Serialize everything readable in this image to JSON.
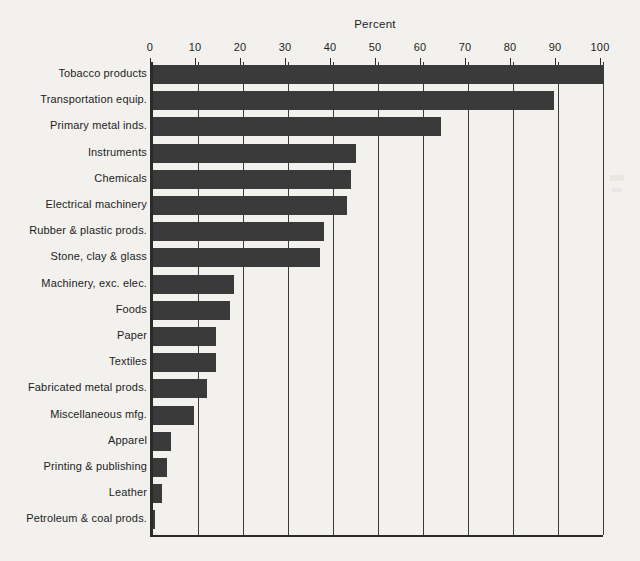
{
  "chart_data": {
    "type": "bar",
    "orientation": "horizontal",
    "title": "Percent",
    "xlabel": "Percent",
    "ylabel": "",
    "xlim": [
      0,
      100
    ],
    "grid": true,
    "legend": false,
    "xticks": [
      0,
      10,
      20,
      30,
      40,
      50,
      60,
      70,
      80,
      90,
      100
    ],
    "xtick_labels": [
      "0",
      "10",
      "20",
      "30",
      "40",
      "50",
      "60",
      "70",
      "80",
      "90",
      "100"
    ],
    "categories": [
      "Tobacco products",
      "Transportation equip.",
      "Primary metal inds.",
      "Instruments",
      "Chemicals",
      "Electrical machinery",
      "Rubber & plastic prods.",
      "Stone, clay & glass",
      "Machinery, exc. elec.",
      "Foods",
      "Paper",
      "Textiles",
      "Fabricated metal prods.",
      "Miscellaneous mfg.",
      "Apparel",
      "Printing & publishing",
      "Leather",
      "Petroleum & coal prods."
    ],
    "values": [
      100,
      89,
      64,
      45,
      44,
      43,
      38,
      37,
      18,
      17,
      14,
      14,
      12,
      9,
      4,
      3,
      2,
      0.5
    ],
    "bar_color": "#3a3a3a",
    "background_color": "#f2f1ee",
    "axis_color": "#2b2b2b"
  }
}
